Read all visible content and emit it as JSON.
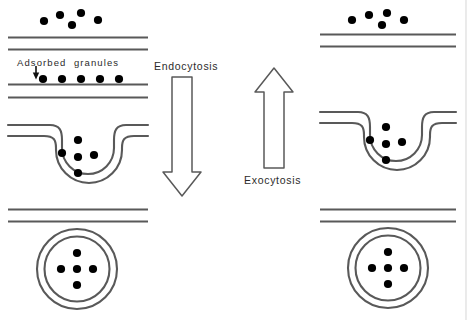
{
  "figure": {
    "width": 467,
    "height": 320,
    "background_color": "#ffffff",
    "ink_color": "#555555",
    "granule_color": "#000000",
    "text_color": "#2b2b2b"
  },
  "labels": {
    "adsorbed_granules": "Adsorbed  granules",
    "endocytosis": "Endocytosis",
    "exocytosis": "Exocytosis"
  },
  "columns": [
    {
      "name": "endocytosis-column",
      "side": "left",
      "direction": "downward",
      "stages": [
        {
          "name": "free-granules-above-membrane",
          "granule_count": 5,
          "granules": [
            {
              "cx": 44,
              "cy": 21
            },
            {
              "cx": 60,
              "cy": 15
            },
            {
              "cx": 72,
              "cy": 25
            },
            {
              "cx": 81,
              "cy": 13
            },
            {
              "cx": 98,
              "cy": 20
            }
          ],
          "membrane_lines": 2
        },
        {
          "name": "adsorbed-granules-on-membrane",
          "granule_count": 5,
          "granules": [
            {
              "cx": 43,
              "cy": 78
            },
            {
              "cx": 62,
              "cy": 78
            },
            {
              "cx": 81,
              "cy": 78
            },
            {
              "cx": 100,
              "cy": 78
            },
            {
              "cx": 119,
              "cy": 78
            }
          ],
          "membrane_lines": 2,
          "has_pointer_arrow": true
        },
        {
          "name": "membrane-invagination-pit",
          "granule_count": 5,
          "granules": [
            {
              "cx": 78,
              "cy": 140
            },
            {
              "cx": 62,
              "cy": 152
            },
            {
              "cx": 77,
              "cy": 156
            },
            {
              "cx": 93,
              "cy": 154
            },
            {
              "cx": 77,
              "cy": 172
            }
          ]
        },
        {
          "name": "internalized-vesicle",
          "granule_count": 5,
          "granules": [
            {
              "cx": 77,
              "cy": 257
            },
            {
              "cx": 62,
              "cy": 270
            },
            {
              "cx": 77,
              "cy": 270
            },
            {
              "cx": 92,
              "cy": 270
            },
            {
              "cx": 77,
              "cy": 283
            }
          ],
          "membrane_lines": 2
        }
      ]
    },
    {
      "name": "exocytosis-column",
      "side": "right",
      "direction": "upward",
      "stages": [
        {
          "name": "released-granules-above-membrane",
          "granule_count": 5,
          "granules": [
            {
              "cx": 352,
              "cy": 19
            },
            {
              "cx": 369,
              "cy": 15
            },
            {
              "cx": 382,
              "cy": 24
            },
            {
              "cx": 387,
              "cy": 13
            },
            {
              "cx": 404,
              "cy": 19
            }
          ],
          "membrane_lines": 2
        },
        {
          "name": "membrane-fusion-pit",
          "granule_count": 5,
          "granules": [
            {
              "cx": 385,
              "cy": 125
            },
            {
              "cx": 368,
              "cy": 137
            },
            {
              "cx": 385,
              "cy": 140
            },
            {
              "cx": 401,
              "cy": 139
            },
            {
              "cx": 385,
              "cy": 157
            }
          ]
        },
        {
          "name": "secretory-vesicle",
          "granule_count": 5,
          "granules": [
            {
              "cx": 388,
              "cy": 255
            },
            {
              "cx": 373,
              "cy": 268
            },
            {
              "cx": 388,
              "cy": 268
            },
            {
              "cx": 403,
              "cy": 268
            },
            {
              "cx": 388,
              "cy": 281
            }
          ],
          "membrane_lines": 2
        }
      ]
    }
  ],
  "arrows": [
    {
      "name": "endocytosis-arrow",
      "label": "Endocytosis",
      "direction": "down",
      "x_center": 182,
      "top": 77,
      "bottom": 196
    },
    {
      "name": "exocytosis-arrow",
      "label": "Exocytosis",
      "direction": "up",
      "x_center": 274,
      "top": 68,
      "bottom": 168
    }
  ]
}
